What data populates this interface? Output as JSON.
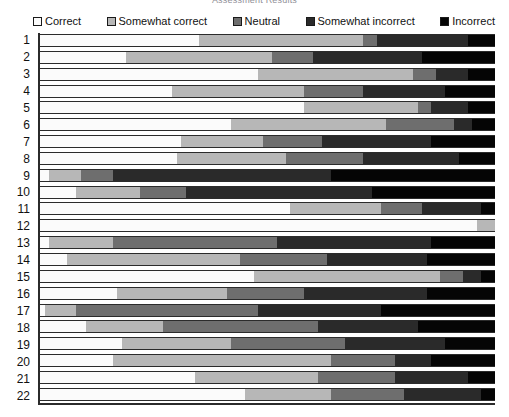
{
  "chart_data": {
    "type": "bar",
    "orientation": "horizontal",
    "stacked": true,
    "normalized_percent": true,
    "title": "Assessment Results",
    "xlabel": "",
    "ylabel": "",
    "xlim": [
      0,
      100
    ],
    "grid": false,
    "legend_position": "top",
    "categories": [
      "1",
      "2",
      "3",
      "4",
      "5",
      "6",
      "7",
      "8",
      "9",
      "10",
      "11",
      "12",
      "13",
      "14",
      "15",
      "16",
      "17",
      "18",
      "19",
      "20",
      "21",
      "22"
    ],
    "series": [
      {
        "name": "Correct",
        "color": "#fbfbfb",
        "values": [
          35,
          19,
          48,
          29,
          58,
          42,
          31,
          30,
          2,
          8,
          55,
          96,
          2,
          6,
          47,
          17,
          1,
          10,
          18,
          16,
          34,
          45
        ]
      },
      {
        "name": "Somewhat correct",
        "color": "#b7b7b7",
        "values": [
          36,
          32,
          34,
          29,
          25,
          34,
          18,
          24,
          7,
          14,
          20,
          4,
          14,
          38,
          41,
          24,
          7,
          17,
          24,
          48,
          27,
          19
        ]
      },
      {
        "name": "Neutral",
        "color": "#6e6e6e",
        "values": [
          3,
          9,
          5,
          13,
          3,
          15,
          13,
          17,
          7,
          10,
          9,
          0,
          36,
          19,
          5,
          17,
          40,
          34,
          25,
          14,
          17,
          16
        ]
      },
      {
        "name": "Somewhat incorrect",
        "color": "#2a2a2a",
        "values": [
          20,
          24,
          7,
          18,
          8,
          4,
          24,
          21,
          48,
          41,
          13,
          0,
          34,
          22,
          4,
          27,
          27,
          22,
          22,
          8,
          16,
          17
        ]
      },
      {
        "name": "Incorrect",
        "color": "#050505",
        "values": [
          6,
          16,
          6,
          11,
          6,
          5,
          14,
          8,
          36,
          27,
          3,
          0,
          14,
          15,
          3,
          15,
          25,
          17,
          11,
          14,
          6,
          3
        ]
      }
    ]
  }
}
